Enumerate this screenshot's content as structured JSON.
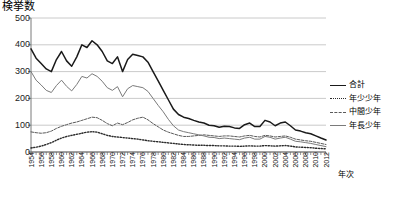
{
  "chart_data": {
    "type": "line",
    "title": "",
    "ylabel": "検挙数",
    "xlabel": "年次",
    "ylim": [
      0,
      500
    ],
    "yticks": [
      0,
      100,
      200,
      300,
      400,
      500
    ],
    "grid": true,
    "legend_position": "right",
    "x": [
      1954,
      1955,
      1956,
      1957,
      1958,
      1959,
      1960,
      1961,
      1962,
      1963,
      1964,
      1965,
      1966,
      1967,
      1968,
      1969,
      1970,
      1971,
      1972,
      1973,
      1974,
      1975,
      1976,
      1977,
      1978,
      1979,
      1980,
      1981,
      1982,
      1983,
      1984,
      1985,
      1986,
      1987,
      1988,
      1989,
      1990,
      1991,
      1992,
      1993,
      1994,
      1995,
      1996,
      1997,
      1998,
      1999,
      2000,
      2001,
      2002,
      2003,
      2004,
      2005,
      2006,
      2007,
      2008,
      2009,
      2010,
      2011,
      2012
    ],
    "xtick_labels": [
      "1954",
      "1956",
      "1958",
      "1960",
      "1962",
      "1964",
      "1966",
      "1968",
      "1970",
      "1972",
      "1976",
      "1978",
      "1981",
      "1982",
      "1986",
      "1988",
      "1990",
      "1992",
      "1994",
      "1996",
      "1998",
      "2000",
      "2002",
      "2004",
      "2006",
      "2008",
      "2010",
      "2012"
    ],
    "series": [
      {
        "name": "合計",
        "style": "solid-thick",
        "color": "#1a1a1a",
        "values": [
          385,
          350,
          330,
          310,
          300,
          345,
          375,
          340,
          320,
          355,
          400,
          390,
          415,
          400,
          375,
          340,
          330,
          355,
          300,
          345,
          365,
          360,
          355,
          335,
          300,
          265,
          230,
          195,
          160,
          140,
          130,
          125,
          118,
          112,
          108,
          100,
          98,
          92,
          96,
          95,
          90,
          88,
          102,
          108,
          95,
          95,
          118,
          112,
          98,
          108,
          112,
          98,
          82,
          78,
          72,
          68,
          60,
          52,
          45
        ]
      },
      {
        "name": "年少少年",
        "style": "dotted",
        "color": "#2b2b2b",
        "values": [
          15,
          18,
          22,
          28,
          35,
          44,
          52,
          58,
          62,
          66,
          70,
          74,
          76,
          74,
          68,
          62,
          58,
          56,
          54,
          52,
          50,
          48,
          45,
          42,
          40,
          38,
          36,
          34,
          32,
          30,
          28,
          27,
          26,
          25,
          25,
          24,
          24,
          23,
          23,
          22,
          22,
          21,
          22,
          23,
          22,
          22,
          24,
          23,
          22,
          23,
          24,
          22,
          19,
          18,
          17,
          16,
          14,
          13,
          12
        ]
      },
      {
        "name": "中間少年",
        "style": "dashdot",
        "color": "#5a5a5a",
        "values": [
          75,
          72,
          70,
          72,
          78,
          88,
          96,
          102,
          108,
          112,
          118,
          124,
          130,
          128,
          118,
          106,
          98,
          108,
          102,
          110,
          120,
          126,
          130,
          120,
          106,
          94,
          82,
          74,
          68,
          62,
          58,
          58,
          60,
          62,
          64,
          62,
          60,
          58,
          60,
          60,
          58,
          56,
          60,
          62,
          58,
          56,
          62,
          60,
          56,
          58,
          60,
          55,
          48,
          45,
          42,
          40,
          36,
          32,
          28
        ]
      },
      {
        "name": "年長少年",
        "style": "solid-thin",
        "color": "#7a7a7a",
        "values": [
          300,
          268,
          250,
          230,
          222,
          248,
          268,
          245,
          228,
          252,
          282,
          276,
          292,
          282,
          264,
          240,
          230,
          244,
          206,
          236,
          248,
          244,
          240,
          226,
          200,
          174,
          150,
          122,
          98,
          82,
          76,
          72,
          68,
          64,
          60,
          55,
          54,
          50,
          52,
          50,
          48,
          46,
          52,
          55,
          48,
          48,
          58,
          55,
          48,
          52,
          55,
          48,
          40,
          38,
          35,
          32,
          28,
          24,
          20
        ]
      }
    ]
  },
  "legend": {
    "items": [
      {
        "label": "合計"
      },
      {
        "label": "年少少年"
      },
      {
        "label": "中間少年"
      },
      {
        "label": "年長少年"
      }
    ]
  }
}
